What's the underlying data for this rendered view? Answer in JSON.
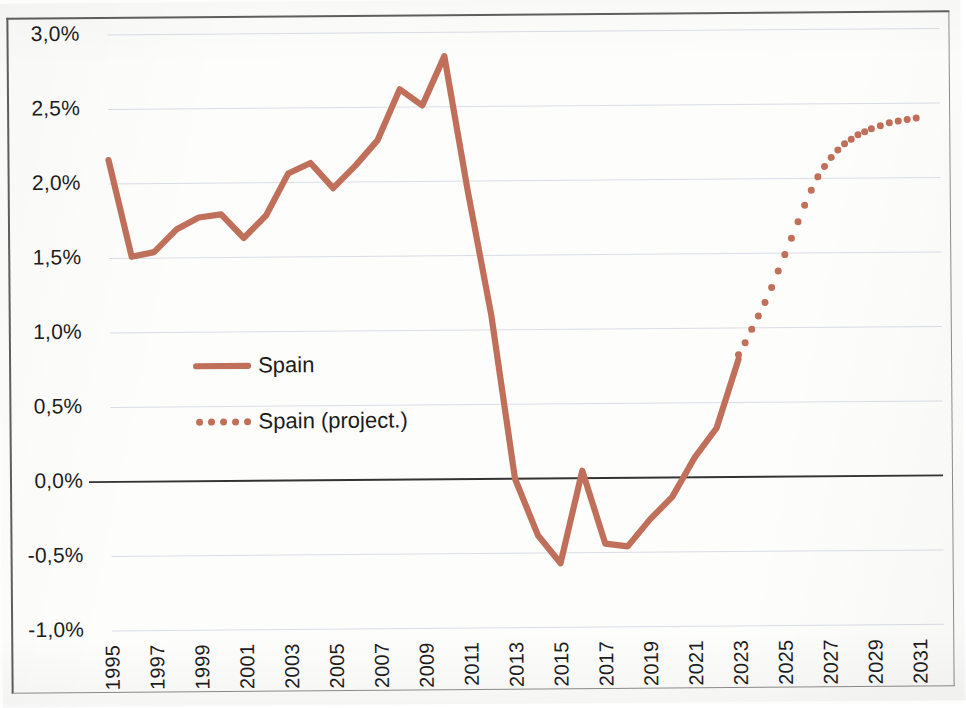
{
  "chart_data": {
    "type": "line",
    "title": "",
    "subtitle": "",
    "xlabel": "",
    "ylabel": "",
    "xlim": [
      1995,
      2031
    ],
    "ylim": [
      -1.0,
      3.0
    ],
    "grid": true,
    "y_tick_format": "percent_comma",
    "y_ticks": [
      "3,0%",
      "2,5%",
      "2,0%",
      "1,5%",
      "1,0%",
      "0,5%",
      "0,0%",
      "-0,5%",
      "-1,0%"
    ],
    "y_tick_values": [
      3.0,
      2.5,
      2.0,
      1.5,
      1.0,
      0.5,
      0.0,
      -0.5,
      -1.0
    ],
    "x_ticks": [
      "1995",
      "1997",
      "1999",
      "2001",
      "2003",
      "2005",
      "2007",
      "2009",
      "2011",
      "2013",
      "2015",
      "2017",
      "2019",
      "2021",
      "2023",
      "2025",
      "2027",
      "2029",
      "2031"
    ],
    "x_tick_values": [
      1995,
      1997,
      1999,
      2001,
      2003,
      2005,
      2007,
      2009,
      2011,
      2013,
      2015,
      2017,
      2019,
      2021,
      2023,
      2025,
      2027,
      2029,
      2031
    ],
    "legend_position": "inside-left",
    "series": [
      {
        "name": "Spain",
        "style": "solid",
        "color": "#c0705a",
        "x": [
          1995,
          1996,
          1997,
          1998,
          1999,
          2000,
          2001,
          2002,
          2003,
          2004,
          2005,
          2006,
          2007,
          2008,
          2009,
          2010,
          2011,
          2012,
          2013,
          2014,
          2015,
          2016,
          2017,
          2018,
          2019,
          2020,
          2021,
          2022,
          2023
        ],
        "values": [
          2.16,
          1.51,
          1.54,
          1.69,
          1.77,
          1.79,
          1.63,
          1.78,
          2.06,
          2.13,
          1.96,
          2.11,
          2.28,
          2.62,
          2.51,
          2.84,
          1.93,
          1.1,
          0.0,
          -0.38,
          -0.57,
          0.05,
          -0.44,
          -0.46,
          -0.28,
          -0.13,
          0.13,
          0.33,
          0.79
        ]
      },
      {
        "name": "Spain (project.)",
        "style": "dotted",
        "color": "#c0705a",
        "x": [
          2023.0,
          2023.3,
          2023.6,
          2023.9,
          2024.2,
          2024.5,
          2024.8,
          2025.1,
          2025.4,
          2025.7,
          2026.0,
          2026.3,
          2026.6,
          2026.9,
          2027.2,
          2027.5,
          2027.8,
          2028.1,
          2028.4,
          2028.7,
          2029.0,
          2029.4,
          2029.8,
          2030.2,
          2030.6,
          2031.0
        ],
        "values": [
          0.82,
          0.9,
          0.99,
          1.08,
          1.17,
          1.27,
          1.38,
          1.49,
          1.6,
          1.71,
          1.82,
          1.92,
          2.01,
          2.08,
          2.14,
          2.19,
          2.23,
          2.26,
          2.29,
          2.31,
          2.33,
          2.35,
          2.37,
          2.38,
          2.39,
          2.4
        ]
      }
    ],
    "legend": [
      {
        "label": "Spain",
        "marker": "solid-line",
        "color": "#c0705a"
      },
      {
        "label": "Spain (project.)",
        "marker": "dotted-line",
        "color": "#c0705a"
      }
    ]
  },
  "colors": {
    "series": "#c0705a",
    "grid": "#d9dde4",
    "zero_axis": "#333333",
    "frame": "#5f5f5f",
    "text": "#1c1c1c",
    "background": "#fdfdfc"
  }
}
